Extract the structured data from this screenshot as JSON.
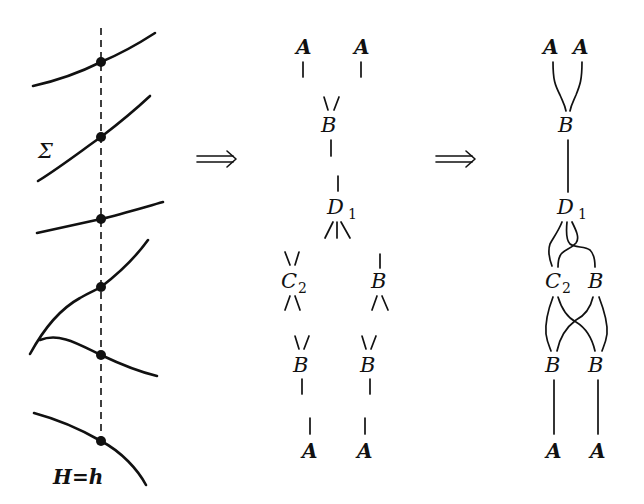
{
  "left_panel": {
    "sigma_label": "Σ",
    "bottom_label": "H=h",
    "point_count": 6
  },
  "arrows": [
    {
      "glyph": "⟹"
    },
    {
      "glyph": "⟹"
    }
  ],
  "middle_panel": {
    "nodes": [
      {
        "id": "A1",
        "label": "A"
      },
      {
        "id": "A2",
        "label": "A"
      },
      {
        "id": "B1",
        "label": "B"
      },
      {
        "id": "D1",
        "label": "D",
        "subscript": "1"
      },
      {
        "id": "C2",
        "label": "C",
        "subscript": "2"
      },
      {
        "id": "B2",
        "label": "B"
      },
      {
        "id": "B3",
        "label": "B"
      },
      {
        "id": "B4",
        "label": "B"
      },
      {
        "id": "A3",
        "label": "A"
      },
      {
        "id": "A4",
        "label": "A"
      }
    ]
  },
  "right_panel": {
    "nodes": [
      {
        "id": "A1",
        "label": "A"
      },
      {
        "id": "A2",
        "label": "A"
      },
      {
        "id": "B1",
        "label": "B"
      },
      {
        "id": "D1",
        "label": "D",
        "subscript": "1"
      },
      {
        "id": "C2",
        "label": "C",
        "subscript": "2"
      },
      {
        "id": "B2",
        "label": "B"
      },
      {
        "id": "B3",
        "label": "B"
      },
      {
        "id": "B4",
        "label": "B"
      },
      {
        "id": "A3",
        "label": "A"
      },
      {
        "id": "A4",
        "label": "A"
      }
    ]
  }
}
